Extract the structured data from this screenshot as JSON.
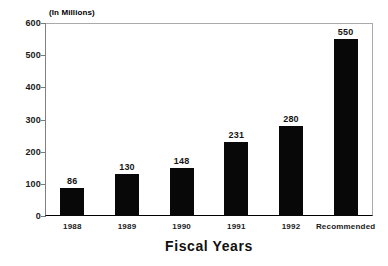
{
  "chart_data": {
    "type": "bar",
    "title": "",
    "unit_note": "(In Millions)",
    "xlabel": "Fiscal Years",
    "ylabel": "",
    "ylim": [
      0,
      600
    ],
    "yticks": [
      600,
      500,
      400,
      300,
      200,
      100,
      0
    ],
    "grid": false,
    "legend": null,
    "bar_color": "#080808",
    "categories": [
      "1988",
      "1989",
      "1990",
      "1991",
      "1992",
      "Recommended"
    ],
    "values": [
      86,
      130,
      148,
      231,
      280,
      550
    ],
    "data_labels": [
      "86",
      "130",
      "148",
      "231",
      "280",
      "550"
    ],
    "series": [
      {
        "name": "Funding",
        "values": [
          86,
          130,
          148,
          231,
          280,
          550
        ]
      }
    ]
  }
}
